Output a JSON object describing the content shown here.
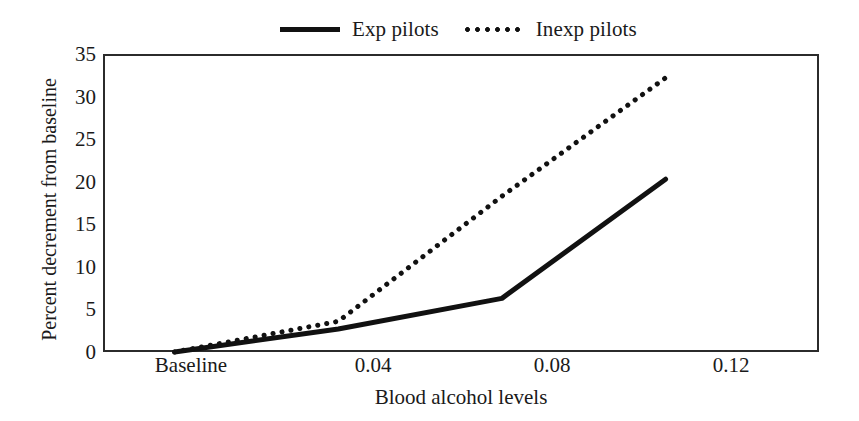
{
  "chart_data": {
    "type": "line",
    "title": "",
    "xlabel": "Blood alcohol levels",
    "ylabel": "Percent decrement from baseline",
    "x_tick_labels": [
      "Baseline",
      "0.04",
      "0.08",
      "0.12"
    ],
    "x_tick_values": [
      0,
      0.04,
      0.08,
      0.12
    ],
    "y_tick_labels": [
      "0",
      "5",
      "10",
      "15",
      "20",
      "25",
      "30",
      "35"
    ],
    "y_tick_values": [
      0,
      5,
      10,
      15,
      20,
      25,
      30,
      35
    ],
    "xlim": [
      -0.0175,
      0.1575
    ],
    "ylim": [
      0,
      35
    ],
    "grid": false,
    "legend_position": "top-center",
    "series": [
      {
        "name": "Exp pilots",
        "style": "solid",
        "color": "#111111",
        "x": [
          0,
          0.04,
          0.08,
          0.12
        ],
        "values": [
          0,
          2.7,
          6.3,
          20.3
        ]
      },
      {
        "name": "Inexp pilots",
        "style": "dotted",
        "color": "#111111",
        "x": [
          0,
          0.04,
          0.08,
          0.12
        ],
        "values": [
          0,
          3.6,
          18.3,
          32.2
        ]
      }
    ]
  },
  "legend": {
    "entries": [
      {
        "label": "Exp pilots",
        "swatch": "solid-line-swatch"
      },
      {
        "label": "Inexp pilots",
        "swatch": "dotted-line-swatch"
      }
    ]
  },
  "axes": {
    "y_title": "Percent decrement from baseline",
    "x_title": "Blood alcohol levels",
    "y_ticks": [
      "35",
      "30",
      "25",
      "20",
      "15",
      "10",
      "5",
      "0"
    ],
    "x_ticks": [
      "Baseline",
      "0.04",
      "0.08",
      "0.12"
    ]
  },
  "colors": {
    "line": "#111111",
    "frame": "#2b2b2b",
    "background": "#ffffff",
    "text": "#1a1a1a"
  }
}
